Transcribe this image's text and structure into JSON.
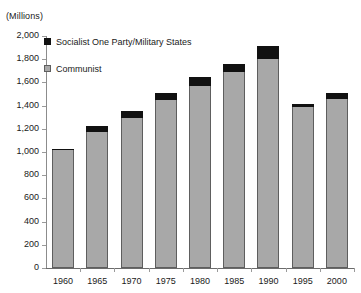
{
  "chart_data": {
    "type": "bar",
    "title": "",
    "subtitle": "",
    "units_caption": "(Millions)",
    "xlabel": "",
    "ylabel": "",
    "ylim": [
      0,
      2000
    ],
    "ytick_step": 200,
    "grid": false,
    "stacked": true,
    "legend_position": "top-left-inside",
    "categories": [
      "1960",
      "1965",
      "1970",
      "1975",
      "1980",
      "1985",
      "1990",
      "1995",
      "2000"
    ],
    "ytick_labels": [
      "0",
      "200",
      "400",
      "600",
      "800",
      "1,000",
      "1,200",
      "1,400",
      "1,600",
      "1,800",
      "2,000"
    ],
    "ytick_values": [
      0,
      200,
      400,
      600,
      800,
      1000,
      1200,
      1400,
      1600,
      1800,
      2000
    ],
    "series": [
      {
        "name": "Communist",
        "color": "#a8a8a8",
        "values": [
          1015,
          1170,
          1290,
          1450,
          1570,
          1690,
          1800,
          1390,
          1455
        ]
      },
      {
        "name": "Socialist One Party/Military States",
        "color": "#111111",
        "values": [
          15,
          55,
          60,
          60,
          75,
          65,
          115,
          25,
          55
        ]
      }
    ],
    "totals": [
      1030,
      1225,
      1350,
      1510,
      1645,
      1755,
      1915,
      1415,
      1510
    ]
  },
  "legend": {
    "items": [
      {
        "label": "Socialist One Party/Military States",
        "swatch": "black-square-swatch"
      },
      {
        "label": "Communist",
        "swatch": "gray-square-swatch"
      }
    ]
  }
}
